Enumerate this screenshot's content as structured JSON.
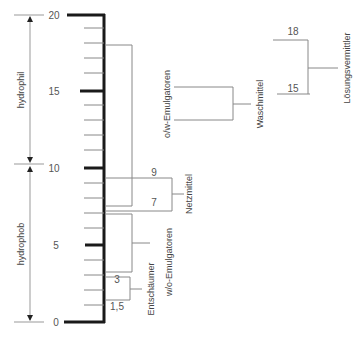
{
  "axis": {
    "ticks": [
      {
        "value": 20,
        "label": "20"
      },
      {
        "value": 15,
        "label": "15"
      },
      {
        "value": 10,
        "label": "10"
      },
      {
        "value": 5,
        "label": "5"
      },
      {
        "value": 0,
        "label": "0"
      }
    ],
    "range": [
      0,
      20
    ],
    "minor_step": 1
  },
  "ranges": {
    "hydrophil": {
      "label": "hydrophil",
      "from": 10,
      "to": 20
    },
    "hydrophob": {
      "label": "hydrophob",
      "from": 0,
      "to": 10
    }
  },
  "markers": {
    "m18": "18",
    "m15": "15",
    "m9": "9",
    "m7": "7",
    "m3": "3",
    "m1_5": "1,5"
  },
  "categories": {
    "loesungsvermittler": "Lösungsvermittler",
    "waschmittel": "Waschmittel",
    "ow_emulgatoren": "o/w-Emulgatoren",
    "netzmittel": "Netzmittel",
    "wo_emulgatoren": "w/o-Emulgatoren",
    "entschaeumer": "Entschäumer"
  },
  "colors": {
    "axis": "#1a1a1a",
    "lines": "#888888",
    "text": "#444444"
  }
}
